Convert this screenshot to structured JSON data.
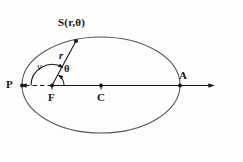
{
  "figure": {
    "kind": "ellipse-orbit-geometry-diagram",
    "background_color": "#fdfdfc",
    "ink_color": "#17171a",
    "curve_color": "#4b4b50",
    "width": 243,
    "height": 162
  },
  "labels": {
    "point_s": "S(r,θ)",
    "point_p": "P",
    "point_a": "A",
    "point_f": "F",
    "point_c": "C",
    "radius_r": "r",
    "angle_nu": "ν",
    "angle_theta": "θ"
  },
  "geometry": {
    "ellipse": {
      "center_x": 101,
      "center_y": 85,
      "semi_major": 79,
      "semi_minor": 48
    },
    "focus": {
      "x": 52,
      "y": 85.5
    },
    "center_point": {
      "x": 101,
      "y": 85.5
    },
    "periapsis": {
      "x": 22,
      "y": 85.5
    },
    "apoapsis": {
      "x": 180,
      "y": 85.5
    },
    "orbit_point_s": {
      "x": 76,
      "y": 41
    },
    "axis": {
      "left_arrow_x": 16,
      "right_arrow_x": 219,
      "y": 85.5,
      "dashed_from_x": 22,
      "dashed_to_x": 52
    },
    "angle_nu_arc_radius": 21,
    "angle_theta_arc_radius": 12
  }
}
